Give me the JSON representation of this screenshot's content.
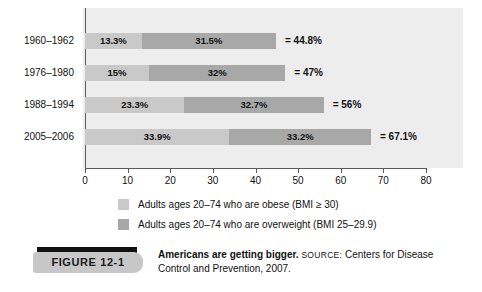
{
  "chart_data": {
    "type": "bar",
    "orientation": "horizontal",
    "stacked": true,
    "title": "Americans are getting bigger.",
    "xlabel": "",
    "ylabel": "",
    "xlim": [
      0,
      80
    ],
    "xticks": [
      0,
      10,
      20,
      30,
      40,
      50,
      60,
      70,
      80
    ],
    "xtick_labels": [
      "0",
      "10",
      "20",
      "30",
      "40",
      "50",
      "60",
      "70",
      "80"
    ],
    "grid": false,
    "legend_position": "bottom",
    "categories": [
      "1960–1962",
      "1976–1980",
      "1988–1994",
      "2005–2006"
    ],
    "series": [
      {
        "name": "Adults ages 20–74 who are obese (BMI ≥ 30)",
        "color": "#c9c9c9",
        "values": [
          13.3,
          15,
          23.3,
          33.9
        ],
        "labels": [
          "13.3%",
          "15%",
          "23.3%",
          "33.9%"
        ]
      },
      {
        "name": "Adults ages 20–74 who are overweight (BMI 25–29.9)",
        "color": "#a8a8a8",
        "values": [
          31.5,
          32,
          32.7,
          33.2
        ],
        "labels": [
          "31.5%",
          "32%",
          "32.7%",
          "33.2%"
        ]
      }
    ],
    "totals": [
      44.8,
      47,
      56,
      67.1
    ],
    "total_labels": [
      "= 44.8%",
      "= 47%",
      "= 56%",
      "= 67.1%"
    ],
    "panel_background": "#ededed",
    "axis_color": "#5a5a5a"
  },
  "rows": [
    {
      "year": "1960–1962",
      "obese_value": 13.3,
      "obese_label": "13.3%",
      "overweight_value": 31.5,
      "overweight_label": "31.5%",
      "total_label": "= 44.8%"
    },
    {
      "year": "1976–1980",
      "obese_value": 15,
      "obese_label": "15%",
      "overweight_value": 32,
      "overweight_label": "32%",
      "total_label": "= 47%"
    },
    {
      "year": "1988–1994",
      "obese_value": 23.3,
      "obese_label": "23.3%",
      "overweight_value": 32.7,
      "overweight_label": "32.7%",
      "total_label": "= 56%"
    },
    {
      "year": "2005–2006",
      "obese_value": 33.9,
      "obese_label": "33.9%",
      "overweight_value": 33.2,
      "overweight_label": "33.2%",
      "total_label": "= 67.1%"
    }
  ],
  "axis": {
    "ticks": [
      "0",
      "10",
      "20",
      "30",
      "40",
      "50",
      "60",
      "70",
      "80"
    ]
  },
  "legend": {
    "items": [
      {
        "swatch_color": "#c9c9c9",
        "label": "Adults ages 20–74 who are obese (BMI ≥ 30)"
      },
      {
        "swatch_color": "#a8a8a8",
        "label": "Adults ages 20–74 who are overweight (BMI 25–29.9)"
      }
    ]
  },
  "figure": {
    "badge": "FIGURE  12-1",
    "caption_title": "Americans are getting bigger.",
    "source_keyword": "SOURCE:",
    "source_text": " Centers for Disease Control and Prevention, 2007."
  }
}
